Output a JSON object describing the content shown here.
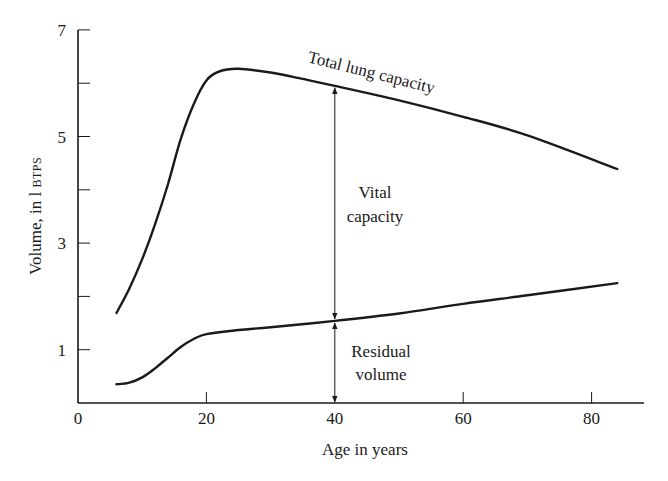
{
  "chart_data": {
    "type": "line",
    "title": "",
    "xlabel": "Age in years",
    "ylabel": "Volume, in l BTPS",
    "ylabel_parts": {
      "main": "Volume, in l ",
      "unit_smallcaps": "BTPS"
    },
    "xlim": [
      0,
      88
    ],
    "ylim": [
      0,
      7
    ],
    "x_ticks": [
      0,
      20,
      40,
      60,
      80
    ],
    "x_tick_labels": [
      "0",
      "20",
      "40",
      "60",
      "80"
    ],
    "y_ticks": [
      0,
      1,
      2,
      3,
      4,
      5,
      6,
      7
    ],
    "y_tick_labels": [
      "",
      "1",
      "",
      "3",
      "",
      "5",
      "",
      "7"
    ],
    "grid": false,
    "legend": null,
    "series": [
      {
        "name": "Total lung capacity",
        "x": [
          6,
          8,
          10,
          12,
          14,
          16,
          18,
          20,
          22,
          25,
          30,
          35,
          40,
          50,
          60,
          70,
          84
        ],
        "values": [
          1.69,
          2.15,
          2.7,
          3.35,
          4.1,
          4.95,
          5.6,
          6.05,
          6.22,
          6.27,
          6.2,
          6.08,
          5.95,
          5.68,
          5.37,
          5.02,
          4.39
        ]
      },
      {
        "name": "Residual volume",
        "x": [
          6,
          8,
          10,
          12,
          14,
          16,
          18,
          20,
          25,
          30,
          40,
          50,
          60,
          70,
          84
        ],
        "values": [
          0.35,
          0.38,
          0.48,
          0.65,
          0.85,
          1.05,
          1.2,
          1.29,
          1.37,
          1.42,
          1.54,
          1.68,
          1.86,
          2.02,
          2.25
        ]
      }
    ],
    "annotations": [
      {
        "text": "Total lung capacity",
        "type": "curve-label",
        "rotation_deg": 14
      },
      {
        "text_lines": [
          "Vital",
          "capacity"
        ],
        "type": "double-arrow",
        "x": 40,
        "from": 1.54,
        "to": 5.95
      },
      {
        "text_lines": [
          "Residual",
          "volume"
        ],
        "type": "double-arrow",
        "x": 40,
        "from": 0,
        "to": 1.54
      }
    ]
  },
  "labels": {
    "tlc": "Total lung capacity",
    "vc_line1": "Vital",
    "vc_line2": "capacity",
    "rv_line1": "Residual",
    "rv_line2": "volume",
    "x_title": "Age in years",
    "y_title_main": "Volume, in l ",
    "y_title_unit": "BTPS"
  },
  "colors": {
    "ink": "#1a1a1a",
    "background": "#ffffff"
  }
}
